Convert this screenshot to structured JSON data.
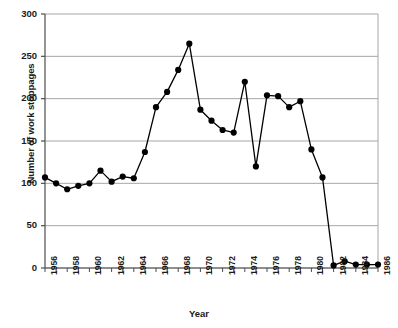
{
  "chart_data": {
    "type": "line",
    "title": "",
    "xlabel": "Year",
    "ylabel": "Number of work stoppages",
    "xlim": [
      1956,
      1986
    ],
    "ylim": [
      0,
      300
    ],
    "ytick_labels": [
      "0",
      "50",
      "100",
      "150",
      "200",
      "250",
      "300"
    ],
    "ytick_values": [
      0,
      50,
      100,
      150,
      200,
      250,
      300
    ],
    "xtick_labels": [
      "1956",
      "1958",
      "1960",
      "1962",
      "1964",
      "1966",
      "1968",
      "1970",
      "1972",
      "1974",
      "1976",
      "1978",
      "1980",
      "1982",
      "1984",
      "1986"
    ],
    "xtick_values": [
      1956,
      1958,
      1960,
      1962,
      1964,
      1966,
      1968,
      1970,
      1972,
      1974,
      1976,
      1978,
      1980,
      1982,
      1984,
      1986
    ],
    "x": [
      1956,
      1957,
      1958,
      1959,
      1960,
      1961,
      1962,
      1963,
      1964,
      1965,
      1966,
      1967,
      1968,
      1969,
      1970,
      1971,
      1972,
      1973,
      1974,
      1975,
      1976,
      1977,
      1978,
      1979,
      1980,
      1981,
      1982,
      1983,
      1984,
      1985,
      1986
    ],
    "values": [
      107,
      100,
      93,
      97,
      100,
      115,
      102,
      108,
      106,
      137,
      190,
      208,
      234,
      265,
      187,
      174,
      163,
      160,
      220,
      120,
      204,
      203,
      190,
      197,
      140,
      107,
      3,
      8,
      4,
      4,
      4
    ],
    "grid": true,
    "grid_color": "#a6a6a6",
    "line_color": "#000000",
    "marker": "circle",
    "marker_color": "#000000",
    "legend": "none"
  }
}
